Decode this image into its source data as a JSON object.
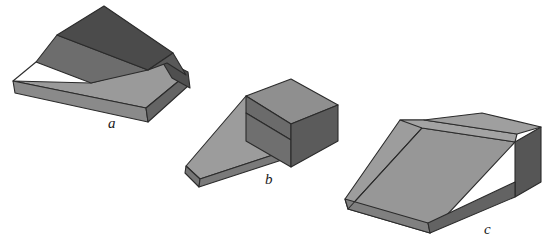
{
  "page": {
    "background_color": "#ffffff",
    "width": 559,
    "height": 251
  },
  "palette": {
    "face_dark": "#4b4b4b",
    "face_dark2": "#565656",
    "face_mid_dark": "#6d6d6d",
    "face_mid": "#808080",
    "face_light": "#9a9a9a",
    "face_lighter": "#a6a6a6",
    "face_lightest": "#b0b0b0",
    "outline": "#2b2b2b",
    "label_color": "#1a1a1a"
  },
  "figures": [
    {
      "id": "figure-a",
      "label": "a",
      "label_position": {
        "x": 108,
        "y": 116
      },
      "description": "Long low wedge prism with a second dark wedge lying across its top, pointing up-right",
      "faces": [
        {
          "name": "upper-wedge-top",
          "color": "#4b4b4b",
          "points": "57,35 104,6 172,54 146,70"
        },
        {
          "name": "upper-wedge-slope",
          "color": "#6d6d6d",
          "points": "36,62 57,35 146,70 91,83"
        },
        {
          "name": "upper-wedge-left-end",
          "color": "#565656",
          "points": "36,62 57,35 38,44"
        },
        {
          "name": "base-top",
          "color": "#9a9a9a",
          "points": "13,81 91,83 167,63 186,75 146,108"
        },
        {
          "name": "base-front",
          "color": "#8a8a8a",
          "points": "13,81 146,108 148,122 15,93"
        },
        {
          "name": "base-left-end",
          "color": "#707070",
          "points": "13,81 15,93 12,86"
        },
        {
          "name": "base-right-end",
          "color": "#666666",
          "points": "146,108 186,75 188,86 148,122"
        },
        {
          "name": "rear-flap",
          "color": "#4f4f4f",
          "points": "167,63 186,75 188,86 178,92"
        }
      ]
    },
    {
      "id": "figure-b",
      "label": "b",
      "label_position": {
        "x": 265,
        "y": 172
      },
      "description": "Flat triangular ramp with a rectangular block sitting on its high right end",
      "faces": [
        {
          "name": "ramp-slope",
          "color": "#9c9c9c",
          "points": "186,165 245,95 290,109 287,149 200,178"
        },
        {
          "name": "ramp-front-edge",
          "color": "#757575",
          "points": "186,165 200,178 199,186 185,172"
        },
        {
          "name": "ramp-right-lower",
          "color": "#7a7a7a",
          "points": "200,178 287,149 287,158 199,186"
        },
        {
          "name": "block-top",
          "color": "#8f8f8f",
          "points": "245,95 290,78 337,104 290,123"
        },
        {
          "name": "block-front-upper",
          "color": "#6b6b6b",
          "points": "245,95 290,123 290,139 245,112"
        },
        {
          "name": "block-front-lower",
          "color": "#6f6f6f",
          "points": "245,112 290,139 290,166 245,140"
        },
        {
          "name": "block-right",
          "color": "#5b5b5b",
          "points": "290,123 337,104 337,140 290,166"
        }
      ]
    },
    {
      "id": "figure-c",
      "label": "c",
      "label_position": {
        "x": 484,
        "y": 222
      },
      "description": "Large wedge ramp with a crease line running down the slope and a dark right side face",
      "faces": [
        {
          "name": "wedge-slope-left",
          "color": "#9d9d9d",
          "points": "347,208 421,127 423,119 399,119 344,198"
        },
        {
          "name": "wedge-slope-right",
          "color": "#9a9a9a",
          "points": "347,208 421,127 514,141 429,232"
        },
        {
          "name": "wedge-top",
          "color": "#a3a3a3",
          "points": "399,119 423,119 516,133 514,141 421,127"
        },
        {
          "name": "wedge-top-cap",
          "color": "#9f9f9f",
          "points": "423,119 481,112 540,126 516,133"
        },
        {
          "name": "wedge-front-strip",
          "color": "#808080",
          "points": "344,198 347,208 429,232 427,222"
        },
        {
          "name": "wedge-right-dark",
          "color": "#565656",
          "points": "514,141 540,126 540,181 514,196"
        },
        {
          "name": "wedge-right-lower",
          "color": "#636363",
          "points": "429,232 514,196 514,181 429,222"
        }
      ]
    }
  ]
}
